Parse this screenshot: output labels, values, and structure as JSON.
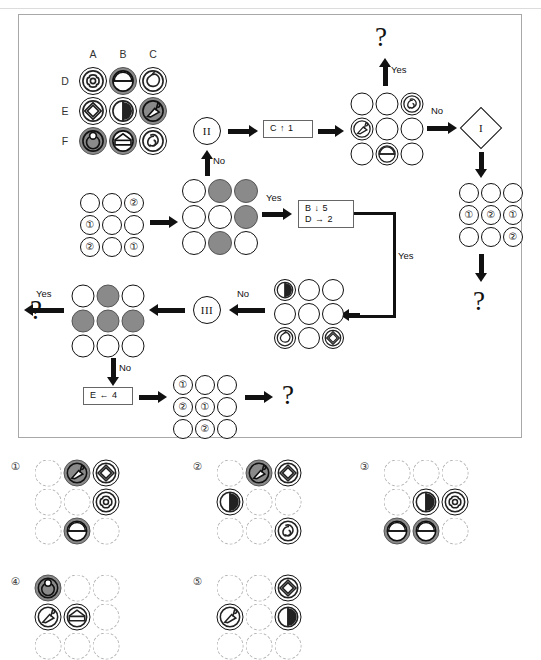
{
  "meta": {
    "domain": "puzzle-flowchart",
    "width": 541,
    "height": 619
  },
  "colors": {
    "ink": "#111111",
    "gray_fill": "#8a8a8a",
    "panel_border": "#a8a8a8",
    "dashed_circle": "#b4b4b4"
  },
  "flow_panel": {
    "column_headers": [
      "A",
      "B",
      "C"
    ],
    "row_headers": [
      "D",
      "E",
      "F"
    ],
    "legend_grid": {
      "name": "symbol-legend-grid",
      "cells": [
        {
          "row": "D",
          "col": "A",
          "fill": "open",
          "symbol": "concentric-flower"
        },
        {
          "row": "D",
          "col": "B",
          "fill": "gray",
          "symbol": "half-dome"
        },
        {
          "row": "D",
          "col": "C",
          "fill": "open",
          "symbol": "apple-outline"
        },
        {
          "row": "E",
          "col": "A",
          "fill": "open",
          "symbol": "double-diamond"
        },
        {
          "row": "E",
          "col": "B",
          "fill": "open",
          "symbol": "half-moon"
        },
        {
          "row": "E",
          "col": "C",
          "fill": "gray",
          "symbol": "flag-kite"
        },
        {
          "row": "F",
          "col": "A",
          "fill": "gray",
          "symbol": "ring-dot"
        },
        {
          "row": "F",
          "col": "B",
          "fill": "gray",
          "symbol": "house-pentagon"
        },
        {
          "row": "F",
          "col": "C",
          "fill": "open",
          "symbol": "spiral-swirl"
        }
      ]
    },
    "grid_numbers_start": {
      "name": "start-number-grid",
      "cells": [
        [
          "",
          "",
          "2"
        ],
        [
          "1",
          "",
          ""
        ],
        [
          "2",
          "",
          "1"
        ]
      ]
    },
    "grid_filled_stage2": {
      "name": "stage2-fill-grid",
      "cells": [
        [
          "open",
          "gray",
          "gray"
        ],
        [
          "open",
          "open",
          "gray"
        ],
        [
          "open",
          "gray",
          "open"
        ]
      ]
    },
    "grid_symbols_top": {
      "name": "top-symbol-grid",
      "cells": [
        [
          "",
          "",
          "spiral-swirl"
        ],
        [
          "flag-kite",
          "",
          ""
        ],
        [
          "",
          "half-dome",
          ""
        ]
      ]
    },
    "grid_numbers_right": {
      "name": "right-number-grid",
      "cells": [
        [
          "",
          "",
          ""
        ],
        [
          "1",
          "2",
          "1"
        ],
        [
          "",
          "",
          "2"
        ]
      ]
    },
    "grid_symbols_mid": {
      "name": "mid-symbol-grid",
      "cells": [
        [
          "half-moon",
          "",
          ""
        ],
        [
          "",
          "",
          ""
        ],
        [
          "apple-outline",
          "",
          "double-diamond"
        ]
      ]
    },
    "grid_filled_left": {
      "name": "left-fill-grid",
      "cells": [
        [
          "open",
          "gray",
          "open"
        ],
        [
          "gray",
          "gray",
          "gray"
        ],
        [
          "open",
          "open",
          "open"
        ]
      ]
    },
    "grid_numbers_bottom": {
      "name": "bottom-number-grid",
      "cells": [
        [
          "1",
          "",
          ""
        ],
        [
          "2",
          "1",
          ""
        ],
        [
          "",
          "2",
          ""
        ]
      ]
    },
    "rule_boxes": [
      {
        "name": "rule-box-c-up-1",
        "lines": [
          "C ↑ 1"
        ]
      },
      {
        "name": "rule-box-b-d",
        "lines": [
          "B ↓ 5",
          "D → 2"
        ]
      },
      {
        "name": "rule-box-e-left-4",
        "lines": [
          "E ← 4"
        ]
      }
    ],
    "decisions": [
      {
        "name": "decision-two",
        "label": "II"
      },
      {
        "name": "decision-three",
        "label": "III"
      },
      {
        "name": "decision-one",
        "label": "I"
      }
    ],
    "branch_labels": {
      "yes": "Yes",
      "no": "No"
    },
    "edge_labels": [
      {
        "name": "edge-label-yes-top",
        "text": "Yes"
      },
      {
        "name": "edge-label-no-up",
        "text": "No"
      },
      {
        "name": "edge-label-yes-stage2",
        "text": "Yes"
      },
      {
        "name": "edge-label-no-right",
        "text": "No"
      },
      {
        "name": "edge-label-yes-loop",
        "text": "Yes"
      },
      {
        "name": "edge-label-no-mid",
        "text": "No"
      },
      {
        "name": "edge-label-yes-left",
        "text": "Yes"
      },
      {
        "name": "edge-label-no-down",
        "text": "No"
      }
    ],
    "question_marks": [
      {
        "name": "question-mark-top",
        "text": "?"
      },
      {
        "name": "question-mark-right",
        "text": "?"
      },
      {
        "name": "question-mark-left",
        "text": "?"
      },
      {
        "name": "question-mark-bottom",
        "text": "?"
      }
    ]
  },
  "options": [
    {
      "name": "option-1",
      "label": "①",
      "cells": [
        [
          {
            "fill": "dash",
            "symbol": ""
          },
          {
            "fill": "gray",
            "symbol": "flag-kite"
          },
          {
            "fill": "open",
            "symbol": "double-diamond"
          }
        ],
        [
          {
            "fill": "dash",
            "symbol": ""
          },
          {
            "fill": "dash",
            "symbol": ""
          },
          {
            "fill": "open",
            "symbol": "concentric-flower"
          }
        ],
        [
          {
            "fill": "dash",
            "symbol": ""
          },
          {
            "fill": "gray",
            "symbol": "half-dome"
          },
          {
            "fill": "dash",
            "symbol": ""
          }
        ]
      ]
    },
    {
      "name": "option-2",
      "label": "②",
      "cells": [
        [
          {
            "fill": "dash",
            "symbol": ""
          },
          {
            "fill": "gray",
            "symbol": "flag-kite"
          },
          {
            "fill": "open",
            "symbol": "double-diamond"
          }
        ],
        [
          {
            "fill": "open",
            "symbol": "half-moon"
          },
          {
            "fill": "dash",
            "symbol": ""
          },
          {
            "fill": "dash",
            "symbol": ""
          }
        ],
        [
          {
            "fill": "dash",
            "symbol": ""
          },
          {
            "fill": "dash",
            "symbol": ""
          },
          {
            "fill": "open",
            "symbol": "spiral-swirl"
          }
        ]
      ]
    },
    {
      "name": "option-3",
      "label": "③",
      "cells": [
        [
          {
            "fill": "dash",
            "symbol": ""
          },
          {
            "fill": "dash",
            "symbol": ""
          },
          {
            "fill": "dash",
            "symbol": ""
          }
        ],
        [
          {
            "fill": "dash",
            "symbol": ""
          },
          {
            "fill": "open",
            "symbol": "half-moon"
          },
          {
            "fill": "open",
            "symbol": "concentric-flower"
          }
        ],
        [
          {
            "fill": "gray",
            "symbol": "half-dome"
          },
          {
            "fill": "gray",
            "symbol": "half-dome"
          },
          {
            "fill": "dash",
            "symbol": ""
          }
        ]
      ]
    },
    {
      "name": "option-4",
      "label": "④",
      "cells": [
        [
          {
            "fill": "gray",
            "symbol": "ring-dot"
          },
          {
            "fill": "dash",
            "symbol": ""
          },
          {
            "fill": "dash",
            "symbol": ""
          }
        ],
        [
          {
            "fill": "open",
            "symbol": "flag-kite"
          },
          {
            "fill": "open",
            "symbol": "house-pentagon"
          },
          {
            "fill": "dash",
            "symbol": ""
          }
        ],
        [
          {
            "fill": "dash",
            "symbol": ""
          },
          {
            "fill": "dash",
            "symbol": ""
          },
          {
            "fill": "dash",
            "symbol": ""
          }
        ]
      ]
    },
    {
      "name": "option-5",
      "label": "⑤",
      "cells": [
        [
          {
            "fill": "dash",
            "symbol": ""
          },
          {
            "fill": "dash",
            "symbol": ""
          },
          {
            "fill": "open",
            "symbol": "double-diamond"
          }
        ],
        [
          {
            "fill": "open",
            "symbol": "flag-kite"
          },
          {
            "fill": "dash",
            "symbol": ""
          },
          {
            "fill": "open",
            "symbol": "half-moon"
          }
        ],
        [
          {
            "fill": "dash",
            "symbol": ""
          },
          {
            "fill": "dash",
            "symbol": ""
          },
          {
            "fill": "dash",
            "symbol": ""
          }
        ]
      ]
    }
  ]
}
